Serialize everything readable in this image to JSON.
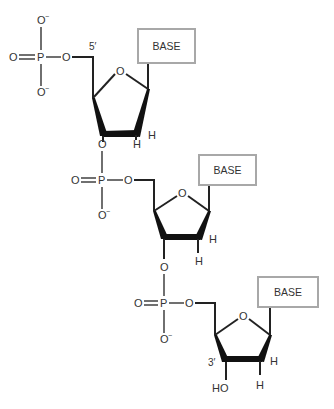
{
  "diagram": {
    "title": "",
    "base_label": "BASE",
    "labels": {
      "five_prime": "5′",
      "three_prime": "3′",
      "hydroxyl": "HO",
      "oxygen": "O",
      "phosphorus": "P",
      "hydrogen": "H",
      "minus": "−"
    },
    "units": [
      {
        "name": "nucleotide-1",
        "phosphate": "PO4",
        "has_5prime_label": true,
        "base": "BASE"
      },
      {
        "name": "nucleotide-2",
        "phosphate": "PO4",
        "base": "BASE"
      },
      {
        "name": "nucleotide-3",
        "phosphate": "PO4",
        "has_3prime_label": true,
        "terminal_group": "HO",
        "base": "BASE"
      }
    ],
    "colors": {
      "bond": "#222222",
      "box_border": "#a8a8a8",
      "text": "#333333"
    }
  }
}
